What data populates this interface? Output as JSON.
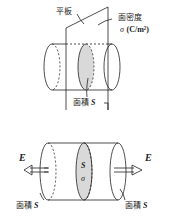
{
  "top_figure": {
    "plate_label": "平板",
    "density_label": "面密度",
    "density_symbol": "σ",
    "density_unit": "(C/m²)",
    "area_label": "面積",
    "area_symbol": "S"
  },
  "bottom_figure": {
    "field_left": "E",
    "field_right": "E",
    "center_area_symbol": "S",
    "center_density_symbol": "σ",
    "left_area_label": "面積",
    "left_area_symbol": "S",
    "right_area_label": "面積",
    "right_area_symbol": "S"
  },
  "colors": {
    "line": "#222222",
    "fill": "#d9d9d9"
  }
}
